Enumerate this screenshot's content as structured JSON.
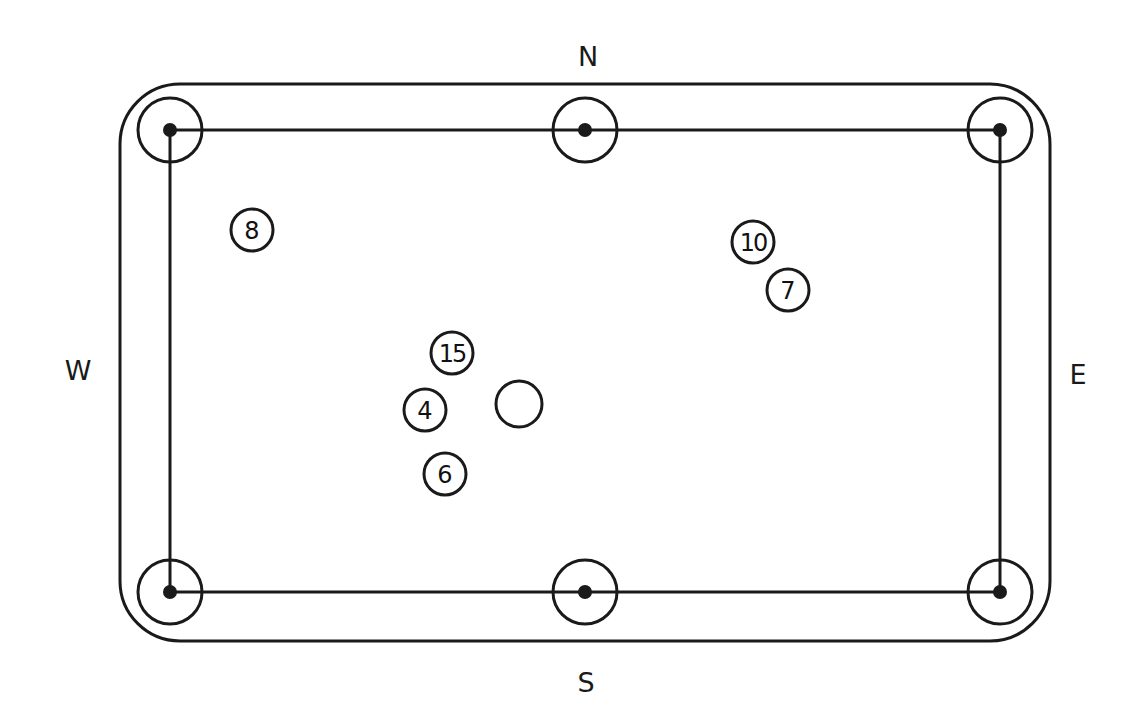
{
  "colors": {
    "line": "#1a1a1a",
    "background": "#ffffff"
  },
  "table": {
    "rail": {
      "x": 120,
      "y": 84,
      "width": 930,
      "height": 557,
      "corner_radius": 60
    },
    "playfield": {
      "x1": 170,
      "y1": 130,
      "x2": 1000,
      "y2": 592
    },
    "pocket_radius": 32,
    "pocket_dot_radius": 7,
    "pockets": [
      {
        "name": "pocket-top-left",
        "x": 170,
        "y": 130
      },
      {
        "name": "pocket-top-middle",
        "x": 585,
        "y": 130
      },
      {
        "name": "pocket-top-right",
        "x": 1000,
        "y": 130
      },
      {
        "name": "pocket-bottom-left",
        "x": 170,
        "y": 592
      },
      {
        "name": "pocket-bottom-middle",
        "x": 585,
        "y": 592
      },
      {
        "name": "pocket-bottom-right",
        "x": 1000,
        "y": 592
      }
    ]
  },
  "compass": {
    "north": {
      "label": "N",
      "x": 588,
      "y": 56
    },
    "south": {
      "label": "S",
      "x": 586,
      "y": 682
    },
    "west": {
      "label": "W",
      "x": 78,
      "y": 370
    },
    "east": {
      "label": "E",
      "x": 1078,
      "y": 374
    }
  },
  "balls": [
    {
      "number": "8",
      "x": 252,
      "y": 230,
      "r": 21
    },
    {
      "number": "10",
      "x": 753,
      "y": 242,
      "r": 21
    },
    {
      "number": "7",
      "x": 788,
      "y": 290,
      "r": 21
    },
    {
      "number": "15",
      "x": 452,
      "y": 353,
      "r": 21
    },
    {
      "number": "4",
      "x": 425,
      "y": 410,
      "r": 21
    },
    {
      "number": "6",
      "x": 445,
      "y": 474,
      "r": 21
    }
  ],
  "cue_ball": {
    "label": "",
    "x": 519,
    "y": 404,
    "r": 23
  }
}
